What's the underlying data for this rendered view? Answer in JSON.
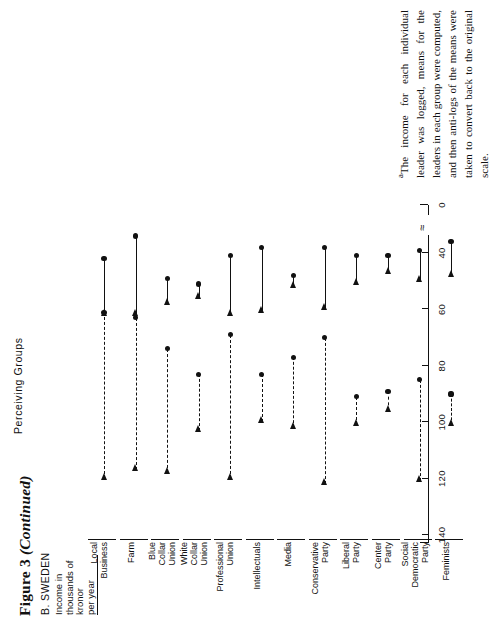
{
  "figure": {
    "title_main": "Figure 3",
    "title_italic": "(Continued)",
    "panel": "B. SWEDEN",
    "y_axis_label": "Income in\nthousands of\nkronor\nper year",
    "groups_axis_title": "Perceiving Groups"
  },
  "footnote": {
    "marker": "a",
    "text": "The income for each individual leader was logged, means for the leaders in each group were computed, and then anti-logs of the means were taken to convert back to the original scale."
  },
  "chart_data": {
    "type": "bar",
    "title": "B. SWEDEN",
    "xlabel": "Perceiving Groups",
    "ylabel": "Income in thousands of kronor per year",
    "ylim": [
      0,
      140
    ],
    "yticks": [
      140,
      120,
      100,
      80,
      60,
      40,
      0
    ],
    "ytick_labels": [
      "140",
      "120",
      "100",
      "80",
      "60",
      "40",
      "0"
    ],
    "axis_break_after": "40",
    "grid": false,
    "legend": [
      {
        "name": "Estimated income of leaders (perceived)",
        "style": "dashed-arrow"
      },
      {
        "name": "Actual / lower income range",
        "style": "solid-arrow"
      }
    ],
    "categories": [
      "Local\nBusiness",
      "Farm",
      "Blue\nCollar\nUnion",
      "White\nCollar\nUnion",
      "Professional\nUnion",
      "Intellectuals",
      "Media",
      "Conservative\nParty",
      "Liberal\nParty",
      "Center\nParty",
      "Social\nDemocratic\nParty",
      "Feminists"
    ],
    "series": [
      {
        "name": "upper range (dashed)",
        "style": "dashed",
        "segments": [
          {
            "category": "Local Business",
            "from": 120,
            "to": 61
          },
          {
            "category": "Farm",
            "from": 117,
            "to": 63
          },
          {
            "category": "Blue Collar Union",
            "from": 118,
            "to": 74
          },
          {
            "category": "White Collar Union",
            "from": 103,
            "to": 83
          },
          {
            "category": "Professional Union",
            "from": 120,
            "to": 69
          },
          {
            "category": "Intellectuals",
            "from": 100,
            "to": 83
          },
          {
            "category": "Media",
            "from": 102,
            "to": 77
          },
          {
            "category": "Conservative Party",
            "from": 122,
            "to": 70
          },
          {
            "category": "Liberal Party",
            "from": 101,
            "to": 91
          },
          {
            "category": "Center Party",
            "from": 96,
            "to": 89
          },
          {
            "category": "Social Democratic Party",
            "from": 121,
            "to": 85
          },
          {
            "category": "Feminists",
            "from": 101,
            "to": 90
          }
        ]
      },
      {
        "name": "lower range (solid)",
        "style": "solid",
        "segments": [
          {
            "category": "Local Business",
            "from": 62,
            "to": 42
          },
          {
            "category": "Farm",
            "from": 62,
            "to": 34
          },
          {
            "category": "Blue Collar Union",
            "from": 58,
            "to": 49
          },
          {
            "category": "White Collar Union",
            "from": 56,
            "to": 51
          },
          {
            "category": "Professional Union",
            "from": 62,
            "to": 41
          },
          {
            "category": "Intellectuals",
            "from": 61,
            "to": 38
          },
          {
            "category": "Media",
            "from": 52,
            "to": 48
          },
          {
            "category": "Conservative Party",
            "from": 60,
            "to": 38
          },
          {
            "category": "Liberal Party",
            "from": 51,
            "to": 41
          },
          {
            "category": "Center Party",
            "from": 47,
            "to": 41
          },
          {
            "category": "Social Democratic Party",
            "from": 50,
            "to": 39
          },
          {
            "category": "Feminists",
            "from": 48,
            "to": 36
          }
        ]
      }
    ]
  }
}
